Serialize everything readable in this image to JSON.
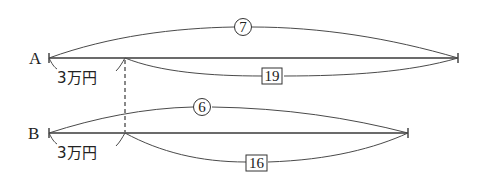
{
  "diagram": {
    "type": "line-segment-diagram",
    "rows": [
      {
        "label": "A",
        "total_ratio_label": "7",
        "total_ratio_style": "circled",
        "left_part_label": "3万円",
        "right_part_label": "19",
        "right_part_style": "boxed"
      },
      {
        "label": "B",
        "total_ratio_label": "6",
        "total_ratio_style": "circled",
        "left_part_label": "3万円",
        "right_part_label": "16",
        "right_part_style": "boxed"
      }
    ],
    "divider": "dashed vertical line aligning both 3万円 division points",
    "colors": {
      "line": "#3a3a3a",
      "background": "#ffffff"
    }
  }
}
